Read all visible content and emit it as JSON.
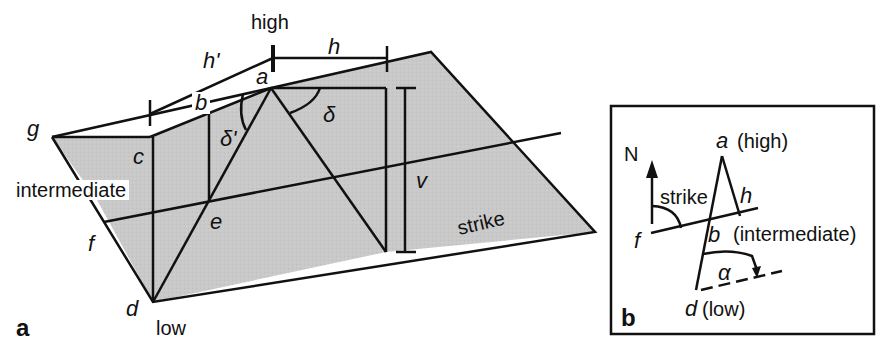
{
  "figure": {
    "panel_a": {
      "panel_label": "a",
      "labels": {
        "high": "high",
        "low": "low",
        "intermediate": "intermediate",
        "strike": "strike",
        "h_prime": "h'",
        "h": "h",
        "v": "v",
        "delta": "δ",
        "delta_prime": "δ'",
        "a": "a",
        "b": "b",
        "c": "c",
        "d": "d",
        "e": "e",
        "f": "f",
        "g": "g"
      }
    },
    "panel_b": {
      "panel_label": "b",
      "labels": {
        "north": "N",
        "strike": "strike",
        "a_high": "(high)",
        "a": "a",
        "h": "h",
        "f": "f",
        "b": "b",
        "b_intermediate": "(intermediate)",
        "alpha": "α",
        "d": "d",
        "d_low": "(low)"
      }
    },
    "colors": {
      "plane_fill": "#c8c8c8",
      "line": "#111111",
      "background": "#ffffff"
    }
  }
}
